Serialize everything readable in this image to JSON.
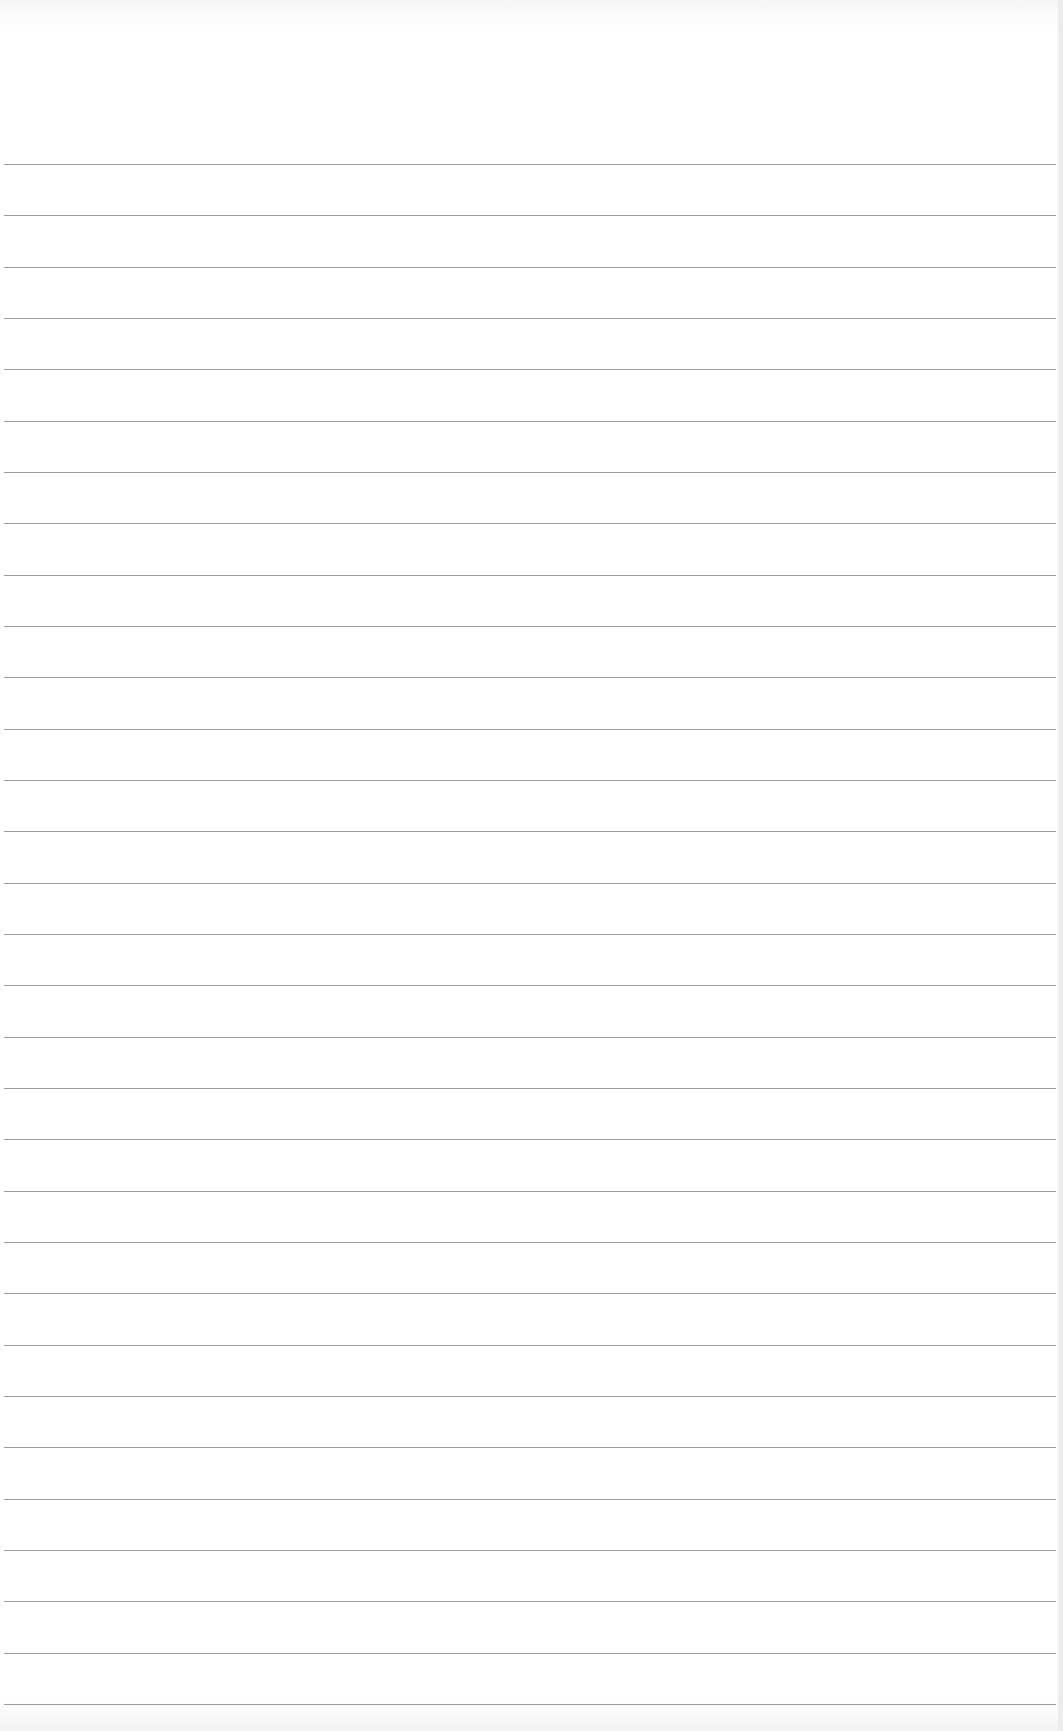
{
  "paper": {
    "type": "lined-paper",
    "line_count": 31,
    "first_line_y": 164,
    "line_spacing": 51.33,
    "line_color": "#8a8a8a",
    "paper_color": "#ffffff"
  }
}
